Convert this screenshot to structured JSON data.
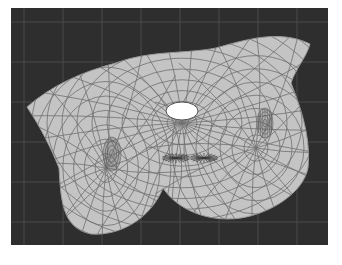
{
  "viewport": {
    "kind": "uv-mesh-editor",
    "background_color": "#2e2e2e",
    "grid_color": "#4a4a4a",
    "mesh_fill_color": "#c4c4c4",
    "mesh_edge_color": "#707070",
    "highlight_color": "#ffffff"
  },
  "mesh": {
    "name": "flattened-uv-shell",
    "features": [
      {
        "name": "top-opening",
        "type": "hole-highlight"
      },
      {
        "name": "left-dense-patch",
        "type": "dense-edge-cluster"
      },
      {
        "name": "right-dense-patch",
        "type": "dense-edge-cluster"
      },
      {
        "name": "center-pinch-left",
        "type": "pinch-point"
      },
      {
        "name": "center-pinch-right",
        "type": "pinch-point"
      }
    ]
  }
}
